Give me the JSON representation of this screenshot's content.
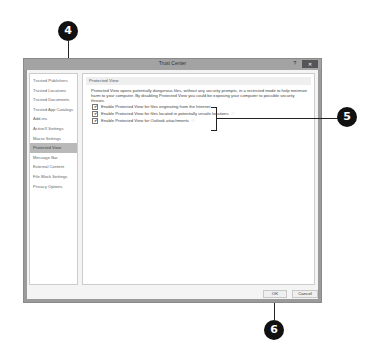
{
  "window": {
    "title": "Trust Center",
    "help_label": "?",
    "close_label": "✕"
  },
  "sidebar": {
    "items": [
      {
        "label": "Trusted Publishers",
        "active": false
      },
      {
        "label": "Trusted Locations",
        "active": false
      },
      {
        "label": "Trusted Documents",
        "active": false
      },
      {
        "label": "Trusted App Catalogs",
        "active": false
      },
      {
        "label": "Add-ins",
        "active": false
      },
      {
        "label": "ActiveX Settings",
        "active": false
      },
      {
        "label": "Macro Settings",
        "active": false
      },
      {
        "label": "Protected View",
        "active": true
      },
      {
        "label": "Message Bar",
        "active": false
      },
      {
        "label": "External Content",
        "active": false
      },
      {
        "label": "File Block Settings",
        "active": false
      },
      {
        "label": "Privacy Options",
        "active": false
      }
    ]
  },
  "main": {
    "section_title": "Protected View",
    "description": "Protected View opens potentially dangerous files, without any security prompts, in a restricted mode to help minimize harm to your computer. By disabling Protected View you could be exposing your computer to possible security threats.",
    "options": [
      {
        "label": "Enable Protected View for files originating from the Internet",
        "checked": true,
        "info": false
      },
      {
        "label": "Enable Protected View for files located in potentially unsafe locations",
        "checked": true,
        "info": true
      },
      {
        "label": "Enable Protected View for Outlook attachments",
        "checked": true,
        "info": true
      }
    ]
  },
  "footer": {
    "ok_label": "OK",
    "cancel_label": "Cancel"
  },
  "callouts": {
    "c4": "4",
    "c5": "5",
    "c6": "6"
  },
  "icons": {
    "check": "✔",
    "info": "ⓘ"
  }
}
